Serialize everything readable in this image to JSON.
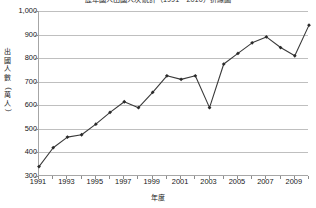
{
  "chart_data": {
    "type": "line",
    "title": "歷年國人出國人次統計（1991－2010）折線圖",
    "xlabel": "年度",
    "ylabel": "出國人數（萬人）",
    "ylabel_chars": [
      "出",
      "國",
      "人",
      "數",
      "（",
      "萬",
      "人",
      "）"
    ],
    "categories": [
      1991,
      1992,
      1993,
      1994,
      1995,
      1996,
      1997,
      1998,
      1999,
      2000,
      2001,
      2002,
      2003,
      2004,
      2005,
      2006,
      2007,
      2008,
      2009,
      2010
    ],
    "values": [
      340,
      420,
      465,
      475,
      520,
      570,
      615,
      590,
      655,
      725,
      710,
      725,
      590,
      775,
      820,
      865,
      890,
      845,
      810,
      940
    ],
    "series": [
      {
        "name": "出國人數",
        "values": [
          340,
          420,
          465,
          475,
          520,
          570,
          615,
          590,
          655,
          725,
          710,
          725,
          590,
          775,
          820,
          865,
          890,
          845,
          810,
          940
        ]
      }
    ],
    "ylim": [
      300,
      1000
    ],
    "xlim": [
      1991,
      2010
    ],
    "ytick_values": [
      300,
      400,
      500,
      600,
      700,
      800,
      900,
      1000
    ],
    "ytick_labels": [
      "300",
      "400",
      "500",
      "600",
      "700",
      "800",
      "900",
      "1,000"
    ],
    "xtick_values": [
      1991,
      1993,
      1995,
      1997,
      1999,
      2001,
      2003,
      2005,
      2007,
      2009
    ],
    "xtick_labels": [
      "1991",
      "1993",
      "1995",
      "1997",
      "1999",
      "2001",
      "2003",
      "2005",
      "2007",
      "2009"
    ],
    "grid": true,
    "grid_axis": "y",
    "legend": false,
    "legend_position": "none",
    "marker": "diamond",
    "line_color": "#3a3a3a",
    "marker_color": "#2a2a2a",
    "grid_color": "#bfbfbf",
    "axis_color": "#a6a6a6",
    "background_color": "#ffffff"
  }
}
